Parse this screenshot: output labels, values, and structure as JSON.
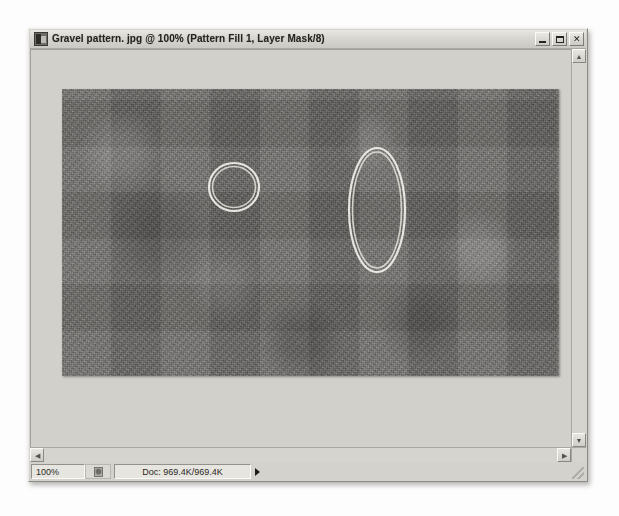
{
  "window": {
    "title": "Gravel pattern. jpg @ 100% (Pattern Fill 1, Layer Mask/8)",
    "app_icon": "photoshop-document-icon",
    "controls": {
      "minimize": "minimize-button",
      "maximize": "maximize-button",
      "close_label": "✕"
    }
  },
  "status_bar": {
    "zoom_level": "100%",
    "thumbnail_icon": "document-preview-icon",
    "doc_size": "Doc: 969.4K/969.4K",
    "flyout_icon": "flyout-arrow-icon",
    "resize_grip": "resize-grip"
  },
  "scrollbars": {
    "up_arrow": "▲",
    "down_arrow": "▼",
    "left_arrow": "◀",
    "right_arrow": "▶"
  },
  "canvas": {
    "document_name": "gravel-pattern-image",
    "selections": [
      {
        "name": "small-circle-selection",
        "shape": "ellipse",
        "cx_pct": 34.6,
        "cy_pct": 34.2,
        "rx_pct": 4.8,
        "ry_pct": 8.2,
        "stroke": "#e8e6df"
      },
      {
        "name": "large-ellipse-selection",
        "shape": "ellipse",
        "cx_pct": 63.4,
        "cy_pct": 42.3,
        "rx_pct": 5.4,
        "ry_pct": 21.0,
        "stroke": "#e8e6df"
      }
    ]
  }
}
